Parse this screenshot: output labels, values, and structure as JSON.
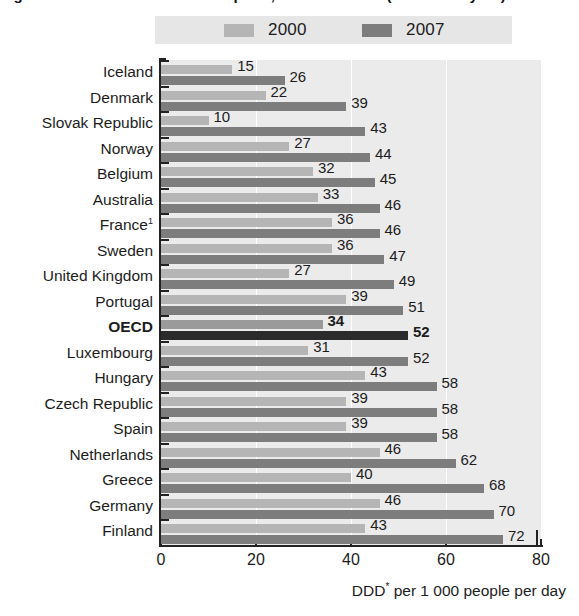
{
  "figure": {
    "cropped_title": "Figure 4.4.1. Antibiotics consumption, 2000 and 2007 (or nearest year)",
    "x_caption_main": "DDD* per 1 000 people per day",
    "x_caption_star": "*"
  },
  "legend": {
    "items": [
      {
        "label": "2000",
        "color": "#b5b5b5",
        "name": "legend-item-2000"
      },
      {
        "label": "2007",
        "color": "#7d7d7d",
        "name": "legend-item-2007"
      }
    ]
  },
  "axis": {
    "x_ticks": [
      "0",
      "20",
      "40",
      "60",
      "80"
    ],
    "x_min": 0,
    "x_max": 80
  },
  "colors": {
    "series_2000": "#b5b5b5",
    "series_2007": "#7d7d7d",
    "highlight_2000": "#9a9a9a",
    "highlight_2007": "#2b2b2b",
    "plot_background": "#ebebeb",
    "gridline": "#ffffff",
    "axis": "#222222"
  },
  "chart_data": {
    "type": "bar",
    "orientation": "horizontal",
    "title": "Antibiotics consumption, 2000 and 2007 (or nearest year)",
    "xlabel": "DDD* per 1 000 people per day",
    "ylabel": "",
    "xlim": [
      0,
      80
    ],
    "xticks": [
      0,
      20,
      40,
      60,
      80
    ],
    "grid": true,
    "legend_position": "top",
    "categories": [
      "Iceland",
      "Denmark",
      "Slovak Republic",
      "Norway",
      "Belgium",
      "Australia",
      "France¹",
      "Sweden",
      "United Kingdom",
      "Portugal",
      "OECD",
      "Luxembourg",
      "Hungary",
      "Czech Republic",
      "Spain",
      "Netherlands",
      "Greece",
      "Germany",
      "Finland"
    ],
    "series": [
      {
        "name": "2000",
        "values": [
          15,
          22,
          10,
          27,
          32,
          33,
          36,
          36,
          27,
          39,
          34,
          31,
          43,
          39,
          39,
          46,
          40,
          46,
          43
        ]
      },
      {
        "name": "2007",
        "values": [
          26,
          39,
          43,
          44,
          45,
          46,
          46,
          47,
          49,
          51,
          52,
          52,
          58,
          58,
          58,
          62,
          68,
          70,
          72
        ]
      }
    ],
    "highlight_category": "OECD",
    "footnote_marker": "1"
  },
  "rows": [
    {
      "label": "Iceland",
      "sup": "",
      "v2000": 15,
      "v2007": 26,
      "highlight": false
    },
    {
      "label": "Denmark",
      "sup": "",
      "v2000": 22,
      "v2007": 39,
      "highlight": false
    },
    {
      "label": "Slovak Republic",
      "sup": "",
      "v2000": 10,
      "v2007": 43,
      "highlight": false
    },
    {
      "label": "Norway",
      "sup": "",
      "v2000": 27,
      "v2007": 44,
      "highlight": false
    },
    {
      "label": "Belgium",
      "sup": "",
      "v2000": 32,
      "v2007": 45,
      "highlight": false
    },
    {
      "label": "Australia",
      "sup": "",
      "v2000": 33,
      "v2007": 46,
      "highlight": false
    },
    {
      "label": "France",
      "sup": "1",
      "v2000": 36,
      "v2007": 46,
      "highlight": false
    },
    {
      "label": "Sweden",
      "sup": "",
      "v2000": 36,
      "v2007": 47,
      "highlight": false
    },
    {
      "label": "United Kingdom",
      "sup": "",
      "v2000": 27,
      "v2007": 49,
      "highlight": false
    },
    {
      "label": "Portugal",
      "sup": "",
      "v2000": 39,
      "v2007": 51,
      "highlight": false
    },
    {
      "label": "OECD",
      "sup": "",
      "v2000": 34,
      "v2007": 52,
      "highlight": true
    },
    {
      "label": "Luxembourg",
      "sup": "",
      "v2000": 31,
      "v2007": 52,
      "highlight": false
    },
    {
      "label": "Hungary",
      "sup": "",
      "v2000": 43,
      "v2007": 58,
      "highlight": false
    },
    {
      "label": "Czech Republic",
      "sup": "",
      "v2000": 39,
      "v2007": 58,
      "highlight": false
    },
    {
      "label": "Spain",
      "sup": "",
      "v2000": 39,
      "v2007": 58,
      "highlight": false
    },
    {
      "label": "Netherlands",
      "sup": "",
      "v2000": 46,
      "v2007": 62,
      "highlight": false
    },
    {
      "label": "Greece",
      "sup": "",
      "v2000": 40,
      "v2007": 68,
      "highlight": false
    },
    {
      "label": "Germany",
      "sup": "",
      "v2000": 46,
      "v2007": 70,
      "highlight": false
    },
    {
      "label": "Finland",
      "sup": "",
      "v2000": 43,
      "v2007": 72,
      "highlight": false
    }
  ]
}
